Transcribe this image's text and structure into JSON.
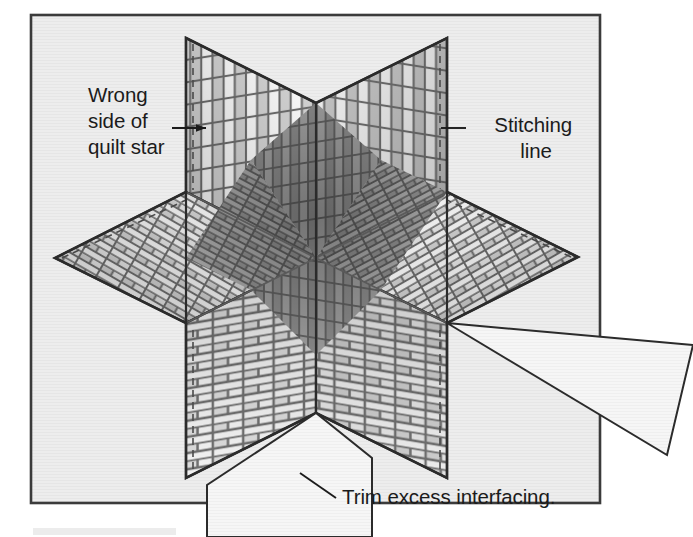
{
  "figure": {
    "kind": "instructional-diagram",
    "frame": {
      "border_color": "#3b3b3b",
      "fill_color": "#ededed",
      "x": 31,
      "y": 15,
      "width": 569,
      "height": 488
    },
    "colors": {
      "page_background": "#ffffff",
      "panel_background": "#ededed",
      "outline": "#2b2b2b",
      "mortar": "#6f6f6f",
      "brick_light": "#ffffff",
      "brick_mid": "#cfcfcf",
      "brick_dark": "#9a9a9a",
      "brick_shadow": "#828282",
      "flap_fill": "#f4f4f4",
      "footer_bar": "#e9e9e9"
    },
    "labels": [
      {
        "name": "wrong-side-of-quilt-star",
        "lines": [
          "Wrong",
          "side of",
          "quilt star"
        ],
        "align": "start",
        "x": 88,
        "y": 102,
        "line_height": 26,
        "leader": "horizontal arrow pointing right to upper-left panel"
      },
      {
        "name": "stitching-line",
        "lines": [
          "Stitching",
          "line"
        ],
        "align": "middle",
        "x": 536,
        "y": 132,
        "line_height": 26,
        "leader": "short horizontal line to dashed stitching line on upper-right panel"
      },
      {
        "name": "trim-excess-interfacing",
        "lines": [
          "Trim excess interfacing."
        ],
        "align": "start",
        "x": 342,
        "y": 504,
        "line_height": 26,
        "leader": "diagonal line up-left to bottom interfacing flap"
      }
    ],
    "star": {
      "points": 6,
      "center": [
        316,
        258
      ],
      "tips": [
        {
          "name": "top-left-point",
          "x": 186,
          "y": 38
        },
        {
          "name": "top-right-point",
          "x": 447,
          "y": 38
        },
        {
          "name": "right-point",
          "x": 578,
          "y": 257
        },
        {
          "name": "bottom-right-point",
          "x": 447,
          "y": 478
        },
        {
          "name": "bottom-left-point",
          "x": 186,
          "y": 478
        },
        {
          "name": "left-point",
          "x": 55,
          "y": 258
        }
      ],
      "facets": [
        {
          "name": "upper-left-panel",
          "shade": "light"
        },
        {
          "name": "upper-right-panel",
          "shade": "light"
        },
        {
          "name": "right-panel",
          "shade": "mid"
        },
        {
          "name": "lower-right-panel",
          "shade": "mid"
        },
        {
          "name": "lower-left-panel",
          "shade": "light-mid"
        },
        {
          "name": "left-panel",
          "shade": "mid"
        },
        {
          "name": "center-well",
          "shade": "dark"
        }
      ],
      "stitching_line_style": "dashed"
    },
    "interfacing_flaps": [
      {
        "name": "right-interfacing-flap",
        "shape": "triangle"
      },
      {
        "name": "bottom-interfacing-flap",
        "shape": "quadrilateral"
      }
    ]
  }
}
